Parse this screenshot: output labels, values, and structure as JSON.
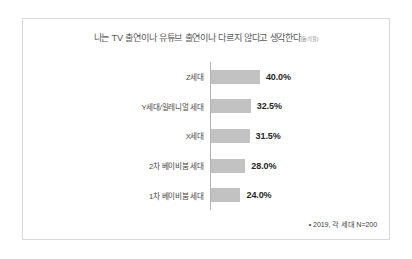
{
  "chart_data": {
    "type": "bar",
    "orientation": "horizontal",
    "title": "나는 TV 출연이나 유튜브 출연이나 다르지 않다고 생각한다",
    "title_suffix": "(동의율)",
    "categories": [
      "Z세대",
      "Y세대/밀레니얼 세대",
      "X세대",
      "2차 베이비붐 세대",
      "1차 베이비붐 세대"
    ],
    "values": [
      40.0,
      32.5,
      31.5,
      28.0,
      24.0
    ],
    "value_labels": [
      "40.0%",
      "32.5%",
      "31.5%",
      "28.0%",
      "24.0%"
    ],
    "xlabel": "",
    "ylabel": "",
    "xlim": [
      0,
      40
    ],
    "grid": false,
    "legend": null,
    "bar_color": "#c2c2c2",
    "axis_color": "#b3b3b3",
    "footnote": "• 2019, 각 세대 N=200"
  }
}
